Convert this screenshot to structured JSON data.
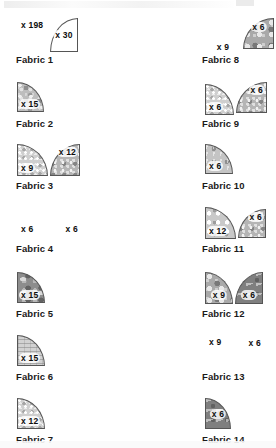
{
  "document": {
    "type": "quilting-cutting-chart",
    "page_note": "Fabric piece cutting chart — 21 fabrics, 3 columns",
    "top_cutoff_text": ""
  },
  "columns": [
    {
      "id": "column-1",
      "entries": [
        {
          "caption": "Fabric 1",
          "pieces": [
            {
              "shape": "concave-br",
              "texture": "plain",
              "qty": "x 198",
              "qty_pos": "top-left"
            },
            {
              "shape": "q-tl",
              "texture": "plain",
              "qty": "x 30",
              "qty_pos": "center"
            }
          ]
        },
        {
          "caption": "Fabric 2",
          "pieces": [
            {
              "shape": "q-tr",
              "texture": "tex-a",
              "qty": "x 15",
              "qty_pos": "bottom-left"
            }
          ]
        },
        {
          "caption": "Fabric 3",
          "pieces": [
            {
              "shape": "q-tr",
              "texture": "tex-c",
              "qty": "x 9",
              "qty_pos": "bottom-left"
            },
            {
              "shape": "q-tl",
              "texture": "tex-g",
              "qty": "x 12",
              "qty_pos": "top-right"
            }
          ]
        },
        {
          "caption": "Fabric 4",
          "pieces": [
            {
              "shape": "concave-br",
              "texture": "tex-c",
              "qty": "x 6",
              "qty_pos": "bottom-left"
            },
            {
              "shape": "concave-bl",
              "texture": "tex-c",
              "qty": "x 6",
              "qty_pos": "bottom-right"
            }
          ]
        },
        {
          "caption": "Fabric 5",
          "pieces": [
            {
              "shape": "q-tr",
              "texture": "tex-h",
              "qty": "x 15",
              "qty_pos": "bottom-left"
            }
          ]
        },
        {
          "caption": "Fabric 6",
          "pieces": [
            {
              "shape": "q-tr",
              "texture": "tex-f",
              "qty": "x 15",
              "qty_pos": "bottom-left"
            }
          ]
        },
        {
          "caption": "Fabric 7",
          "pieces": [
            {
              "shape": "q-tr",
              "texture": "tex-c",
              "qty": "x 12",
              "qty_pos": "bottom-left"
            }
          ]
        }
      ]
    },
    {
      "id": "column-2",
      "entries": [
        {
          "caption": "Fabric 8",
          "pieces": [
            {
              "shape": "concave-br",
              "texture": "tex-e",
              "qty": "x 9",
              "qty_pos": "bottom-center"
            },
            {
              "shape": "q-tl",
              "texture": "tex-b",
              "qty": "x 6",
              "qty_pos": "top-center"
            }
          ]
        },
        {
          "caption": "Fabric 9",
          "pieces": [
            {
              "shape": "q-tr",
              "texture": "tex-c",
              "qty": "x 6",
              "qty_pos": "bottom-left"
            },
            {
              "shape": "q-tl",
              "texture": "tex-g",
              "qty": "x 6",
              "qty_pos": "top-right"
            }
          ]
        },
        {
          "caption": "Fabric 10",
          "pieces": [
            {
              "shape": "q-tr",
              "texture": "tex-d",
              "qty": "x 6",
              "qty_pos": "bottom-left"
            }
          ]
        },
        {
          "caption": "Fabric 11",
          "pieces": [
            {
              "shape": "q-tr",
              "texture": "tex-i",
              "qty": "x 12",
              "qty_pos": "bottom-left"
            },
            {
              "shape": "q-tl",
              "texture": "tex-g",
              "qty": "x 6",
              "qty_pos": "top-right"
            }
          ]
        },
        {
          "caption": "Fabric 12",
          "pieces": [
            {
              "shape": "q-tr",
              "texture": "tex-b",
              "qty": "x 9",
              "qty_pos": "bottom-center"
            },
            {
              "shape": "q-tl",
              "texture": "tex-j",
              "qty": "x 6",
              "qty_pos": "bottom-center"
            }
          ]
        },
        {
          "caption": "Fabric 13",
          "pieces": [
            {
              "shape": "concave-br",
              "texture": "tex-c",
              "qty": "x 9",
              "qty_pos": "top-left"
            },
            {
              "shape": "concave-bl",
              "texture": "tex-g",
              "qty": "x 6",
              "qty_pos": "top-right"
            }
          ]
        },
        {
          "caption": "Fabric 14",
          "pieces": [
            {
              "shape": "q-tr",
              "texture": "tex-j",
              "qty": "x 6",
              "qty_pos": "center"
            }
          ]
        }
      ]
    },
    {
      "id": "column-3",
      "entries": [
        {
          "caption": "Fabric 15",
          "pieces": [
            {
              "shape": "q-tr",
              "texture": "tex-c",
              "qty": "x 12",
              "qty_pos": "bottom-left"
            },
            {
              "shape": "q-tl",
              "texture": "tex-c",
              "qty": "x 9",
              "qty_pos": "center"
            }
          ]
        },
        {
          "caption": "Fabric 16",
          "pieces": [
            {
              "shape": "q-tr",
              "texture": "tex-g",
              "qty": "x 6",
              "qty_pos": "top-center"
            }
          ]
        },
        {
          "caption": "Fabric 17",
          "pieces": [
            {
              "shape": "q-tr",
              "texture": "tex-e",
              "qty": "x 9",
              "qty_pos": "bottom-center"
            }
          ]
        },
        {
          "caption": "Fabric 18",
          "pieces": [
            {
              "shape": "q-tr",
              "texture": "tex-a",
              "qty": "x 6",
              "qty_pos": "bottom-center"
            },
            {
              "shape": "q-tl",
              "texture": "tex-g",
              "qty": "x 9",
              "qty_pos": "top-center"
            }
          ]
        },
        {
          "caption": "Fabric 19",
          "pieces": [
            {
              "shape": "concave-br",
              "texture": "tex-f",
              "qty": "x 6",
              "qty_pos": "bottom-left"
            }
          ]
        },
        {
          "caption": "Fabric 20",
          "pieces": [
            {
              "shape": "q-tr",
              "texture": "tex-c",
              "qty": "x 6",
              "qty_pos": "bottom-center"
            },
            {
              "shape": "q-tl",
              "texture": "tex-i",
              "qty": "x 6",
              "qty_pos": "bottom-center"
            }
          ]
        },
        {
          "caption": "Fabric 21",
          "pieces": [
            {
              "shape": "q-tr",
              "texture": "tex-c",
              "qty": "x 6",
              "qty_pos": "top-center"
            }
          ]
        }
      ]
    }
  ]
}
